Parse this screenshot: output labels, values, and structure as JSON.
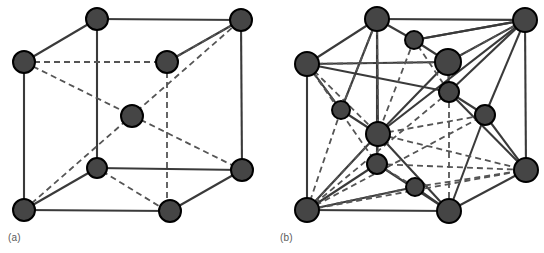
{
  "figure": {
    "background_color": "#ffffff",
    "atom_fill_color": "#454545",
    "atom_stroke_color": "#000000",
    "edge_color": "#3a3a3a",
    "dashed_edge_color": "#555555",
    "caption_color": "#5a5a5a"
  },
  "panels": [
    {
      "id": "a",
      "caption": "(a)",
      "structure_name": "body-centered-cubic",
      "atom_count": 9,
      "atoms": [
        {
          "name": "atom-back-top-left",
          "x": 24,
          "y": 62,
          "r": 11,
          "hidden": true
        },
        {
          "name": "atom-front-top-left",
          "x": 97,
          "y": 19,
          "r": 11,
          "hidden": false
        },
        {
          "name": "atom-back-top-right",
          "x": 167,
          "y": 62,
          "r": 11,
          "hidden": true
        },
        {
          "name": "atom-front-top-right",
          "x": 241,
          "y": 20,
          "r": 11,
          "hidden": false
        },
        {
          "name": "atom-body-center",
          "x": 132,
          "y": 116,
          "r": 11,
          "hidden": false
        },
        {
          "name": "atom-back-bottom-left",
          "x": 24,
          "y": 210,
          "r": 11,
          "hidden": false
        },
        {
          "name": "atom-front-bottom-left",
          "x": 97,
          "y": 168,
          "r": 10,
          "hidden": false
        },
        {
          "name": "atom-back-bottom-right",
          "x": 170,
          "y": 211,
          "r": 11,
          "hidden": false
        },
        {
          "name": "atom-front-bottom-right",
          "x": 242,
          "y": 170,
          "r": 11,
          "hidden": false
        }
      ],
      "solid_edges": [
        [
          24,
          62,
          97,
          19
        ],
        [
          97,
          19,
          241,
          20
        ],
        [
          241,
          20,
          167,
          62
        ],
        [
          24,
          62,
          24,
          210
        ],
        [
          97,
          19,
          97,
          168
        ],
        [
          241,
          20,
          242,
          170
        ],
        [
          24,
          210,
          170,
          211
        ],
        [
          170,
          211,
          242,
          170
        ],
        [
          242,
          170,
          97,
          168
        ],
        [
          97,
          168,
          24,
          210
        ]
      ],
      "dashed_edges": [
        [
          24,
          62,
          167,
          62
        ],
        [
          167,
          62,
          167,
          211
        ],
        [
          167,
          62,
          241,
          20
        ],
        [
          24,
          62,
          242,
          170
        ],
        [
          24,
          210,
          241,
          20
        ],
        [
          167,
          211,
          97,
          168
        ]
      ]
    },
    {
      "id": "b",
      "caption": "(b)",
      "structure_name": "face-centered-cubic-with-interstitials",
      "atom_count": 14,
      "atoms": [
        {
          "name": "atom-back-top-left",
          "x": 307,
          "y": 64,
          "r": 12
        },
        {
          "name": "atom-front-top-left",
          "x": 377,
          "y": 19,
          "r": 12
        },
        {
          "name": "atom-top-face-center",
          "x": 414,
          "y": 40,
          "r": 9
        },
        {
          "name": "atom-front-top-right",
          "x": 525,
          "y": 20,
          "r": 12
        },
        {
          "name": "atom-back-top-right",
          "x": 448,
          "y": 62,
          "r": 13
        },
        {
          "name": "atom-right-upper-small",
          "x": 449,
          "y": 92,
          "r": 10
        },
        {
          "name": "atom-right-face-center",
          "x": 485,
          "y": 115,
          "r": 10
        },
        {
          "name": "atom-left-face-center",
          "x": 341,
          "y": 110,
          "r": 9
        },
        {
          "name": "atom-body-center",
          "x": 378,
          "y": 134,
          "r": 12
        },
        {
          "name": "atom-front-face-center",
          "x": 377,
          "y": 164,
          "r": 10
        },
        {
          "name": "atom-bottom-face-center",
          "x": 415,
          "y": 187,
          "r": 9
        },
        {
          "name": "atom-back-bottom-left",
          "x": 307,
          "y": 210,
          "r": 12
        },
        {
          "name": "atom-back-bottom-right",
          "x": 449,
          "y": 211,
          "r": 12
        },
        {
          "name": "atom-front-bottom-right",
          "x": 526,
          "y": 170,
          "r": 12
        }
      ],
      "solid_edges": [
        [
          307,
          64,
          377,
          19
        ],
        [
          377,
          19,
          525,
          20
        ],
        [
          525,
          20,
          448,
          62
        ],
        [
          307,
          64,
          448,
          62
        ],
        [
          307,
          64,
          307,
          210
        ],
        [
          377,
          19,
          377,
          164
        ],
        [
          525,
          20,
          526,
          170
        ],
        [
          307,
          210,
          449,
          211
        ],
        [
          449,
          211,
          526,
          170
        ],
        [
          526,
          170,
          449,
          92
        ],
        [
          449,
          92,
          307,
          64
        ],
        [
          307,
          64,
          341,
          110
        ],
        [
          341,
          110,
          378,
          134
        ],
        [
          378,
          134,
          448,
          62
        ],
        [
          377,
          19,
          341,
          110
        ],
        [
          377,
          19,
          414,
          40
        ],
        [
          414,
          40,
          448,
          62
        ],
        [
          414,
          40,
          525,
          20
        ],
        [
          448,
          62,
          449,
          92
        ],
        [
          449,
          92,
          485,
          115
        ],
        [
          485,
          115,
          526,
          170
        ],
        [
          307,
          210,
          378,
          134
        ],
        [
          378,
          134,
          377,
          164
        ],
        [
          377,
          164,
          449,
          211
        ],
        [
          449,
          211,
          485,
          115
        ],
        [
          449,
          211,
          378,
          134
        ],
        [
          307,
          210,
          377,
          164
        ],
        [
          525,
          20,
          414,
          40
        ],
        [
          525,
          20,
          378,
          134
        ],
        [
          525,
          20,
          449,
          92
        ],
        [
          525,
          20,
          485,
          115
        ],
        [
          377,
          19,
          378,
          134
        ],
        [
          415,
          187,
          449,
          211
        ],
        [
          307,
          210,
          415,
          187
        ]
      ],
      "dashed_edges": [
        [
          307,
          64,
          449,
          62
        ],
        [
          449,
          62,
          449,
          211
        ],
        [
          448,
          62,
          525,
          20
        ],
        [
          377,
          19,
          378,
          134
        ],
        [
          377,
          19,
          341,
          110
        ],
        [
          307,
          64,
          378,
          134
        ],
        [
          307,
          64,
          341,
          110
        ],
        [
          341,
          110,
          307,
          210
        ],
        [
          307,
          210,
          378,
          134
        ],
        [
          307,
          210,
          485,
          115
        ],
        [
          307,
          210,
          415,
          187
        ],
        [
          307,
          210,
          449,
          92
        ],
        [
          307,
          210,
          526,
          170
        ],
        [
          377,
          164,
          526,
          170
        ],
        [
          378,
          134,
          485,
          115
        ],
        [
          378,
          134,
          526,
          170
        ],
        [
          415,
          187,
          526,
          170
        ],
        [
          377,
          164,
          415,
          187
        ],
        [
          414,
          40,
          378,
          134
        ],
        [
          449,
          92,
          414,
          40
        ],
        [
          307,
          64,
          377,
          164
        ]
      ]
    }
  ]
}
